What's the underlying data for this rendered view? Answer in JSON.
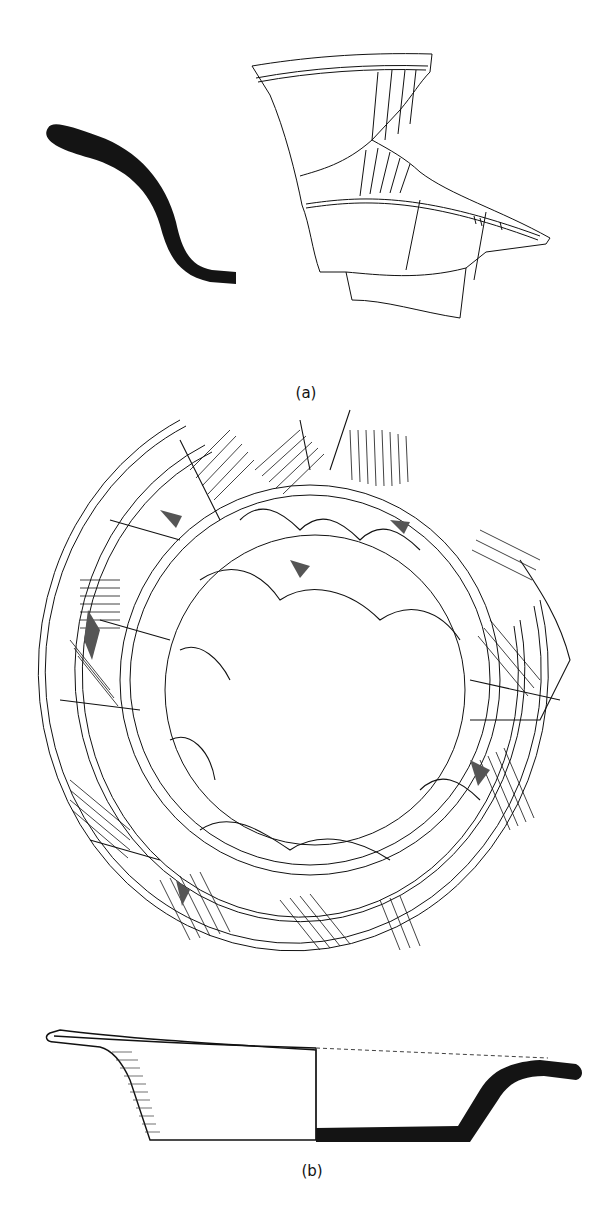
{
  "figure": {
    "panel_a": {
      "label": "(a)",
      "components": [
        "rim-profile-section",
        "decorated-sherd-fragment"
      ]
    },
    "panel_b": {
      "label": "(b)",
      "components": [
        "bowl-plan-view-reconstructed",
        "bowl-profile-section"
      ]
    }
  },
  "colors": {
    "background": "#ffffff",
    "ink": "#111111",
    "section_fill": "#141414",
    "crack_fill": "#555555"
  }
}
